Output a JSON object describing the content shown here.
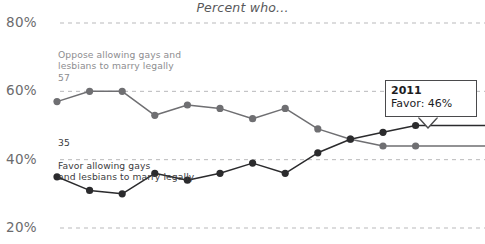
{
  "chart": {
    "title": "Percent who...",
    "background": "#ffffff"
  },
  "axis": {
    "y_ticks": [
      "80%",
      "60%",
      "40%",
      "20%"
    ],
    "y_tick_values": [
      80,
      60,
      40,
      20
    ],
    "ylim": [
      20,
      80
    ],
    "gridline_color": "#b9b9bb",
    "gridline_style": "dashed",
    "x_axis_visible": false
  },
  "annotations": {
    "oppose": {
      "label": "Oppose allowing gays and\nlesbians to marry legally",
      "value": "57",
      "color": "#8d8d90"
    },
    "favor": {
      "value": "35",
      "label": "Favor allowing gays\nand lesbians to marry legally",
      "color": "#3c3c3e"
    }
  },
  "tooltip": {
    "year": "2011",
    "value_label": "Favor: 46%",
    "border_color": "#4a4a4c"
  },
  "chart_data": {
    "type": "line",
    "title": "Percent who...",
    "xlabel": "",
    "ylabel": "",
    "ylim": [
      20,
      80
    ],
    "grid": true,
    "legend": "inline-annotations",
    "x": [
      1,
      2,
      3,
      4,
      5,
      6,
      7,
      8,
      9,
      10,
      11,
      12
    ],
    "series": [
      {
        "name": "Oppose allowing gays and lesbians to marry legally",
        "color": "#6f6f72",
        "marker_color": "#6f6f72",
        "end_value": 44,
        "values": [
          57,
          60,
          60,
          53,
          56,
          55,
          52,
          55,
          49,
          46,
          44,
          44
        ]
      },
      {
        "name": "Favor allowing gays and lesbians to marry legally",
        "color": "#2b2b2d",
        "marker_color": "#2b2b2d",
        "end_value": 50,
        "values": [
          35,
          31,
          30,
          36,
          34,
          36,
          39,
          36,
          42,
          46,
          48,
          50
        ]
      }
    ],
    "highlight": {
      "series": "Favor",
      "year": "2011",
      "value": 46
    }
  }
}
